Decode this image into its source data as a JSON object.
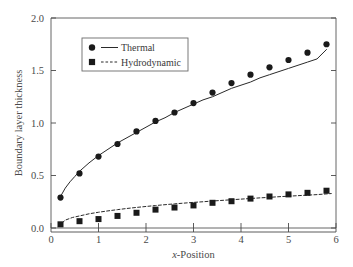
{
  "chart_data": {
    "type": "scatter",
    "title": "",
    "xlabel": "x-Position",
    "xlabel_italic_prefix": "x",
    "xlabel_rest": "-Position",
    "ylabel": "Boundary layer thickness",
    "xlim": [
      0,
      6
    ],
    "ylim": [
      0.0,
      2.0
    ],
    "xticks": [
      "0",
      "1",
      "2",
      "3",
      "4",
      "5",
      "6"
    ],
    "xtick_values": [
      0,
      1,
      2,
      3,
      4,
      5,
      6
    ],
    "yticks": [
      "0.0",
      "0.5",
      "1.0",
      "1.5",
      "2.0"
    ],
    "ytick_values": [
      0.0,
      0.5,
      1.0,
      1.5,
      2.0
    ],
    "grid": false,
    "legend_position": "upper-left-inside",
    "x": [
      0.2,
      0.6,
      1.0,
      1.4,
      1.8,
      2.2,
      2.6,
      3.0,
      3.4,
      3.8,
      4.2,
      4.6,
      5.0,
      5.4,
      5.8
    ],
    "series": [
      {
        "name": "Thermal",
        "marker": "circle",
        "line": "solid",
        "color": "#1a1a1a",
        "values": [
          0.29,
          0.52,
          0.68,
          0.8,
          0.92,
          1.02,
          1.1,
          1.19,
          1.29,
          1.38,
          1.46,
          1.53,
          1.6,
          1.67,
          1.75
        ],
        "fit_curve": {
          "form": "power",
          "points": [
            [
              0.2,
              0.3
            ],
            [
              0.3,
              0.38
            ],
            [
              0.4,
              0.44
            ],
            [
              0.5,
              0.49
            ],
            [
              0.6,
              0.54
            ],
            [
              0.8,
              0.62
            ],
            [
              1.0,
              0.69
            ],
            [
              1.2,
              0.75
            ],
            [
              1.4,
              0.81
            ],
            [
              1.6,
              0.86
            ],
            [
              1.8,
              0.91
            ],
            [
              2.0,
              0.96
            ],
            [
              2.2,
              1.01
            ],
            [
              2.4,
              1.05
            ],
            [
              2.6,
              1.1
            ],
            [
              2.8,
              1.14
            ],
            [
              3.0,
              1.18
            ],
            [
              3.2,
              1.22
            ],
            [
              3.4,
              1.25
            ],
            [
              3.6,
              1.29
            ],
            [
              3.8,
              1.33
            ],
            [
              4.0,
              1.36
            ],
            [
              4.2,
              1.39
            ],
            [
              4.4,
              1.43
            ],
            [
              4.6,
              1.46
            ],
            [
              4.8,
              1.49
            ],
            [
              5.0,
              1.52
            ],
            [
              5.2,
              1.55
            ],
            [
              5.4,
              1.58
            ],
            [
              5.6,
              1.61
            ],
            [
              5.8,
              1.7
            ]
          ]
        }
      },
      {
        "name": "Hydrodynamic",
        "marker": "square",
        "line": "dashed",
        "color": "#1a1a1a",
        "values": [
          0.035,
          0.065,
          0.085,
          0.115,
          0.145,
          0.175,
          0.195,
          0.215,
          0.24,
          0.255,
          0.28,
          0.3,
          0.32,
          0.335,
          0.355
        ],
        "fit_curve": {
          "form": "power",
          "points": [
            [
              0.15,
              0.015
            ],
            [
              0.3,
              0.075
            ],
            [
              0.45,
              0.1
            ],
            [
              0.6,
              0.115
            ],
            [
              0.8,
              0.135
            ],
            [
              1.0,
              0.15
            ],
            [
              1.2,
              0.163
            ],
            [
              1.4,
              0.175
            ],
            [
              1.6,
              0.186
            ],
            [
              1.8,
              0.196
            ],
            [
              2.0,
              0.205
            ],
            [
              2.2,
              0.214
            ],
            [
              2.4,
              0.222
            ],
            [
              2.6,
              0.23
            ],
            [
              2.8,
              0.237
            ],
            [
              3.0,
              0.244
            ],
            [
              3.2,
              0.25
            ],
            [
              3.4,
              0.257
            ],
            [
              3.6,
              0.263
            ],
            [
              3.8,
              0.269
            ],
            [
              4.0,
              0.275
            ],
            [
              4.2,
              0.281
            ],
            [
              4.4,
              0.287
            ],
            [
              4.6,
              0.292
            ],
            [
              4.8,
              0.298
            ],
            [
              5.0,
              0.303
            ],
            [
              5.2,
              0.308
            ],
            [
              5.4,
              0.313
            ],
            [
              5.6,
              0.318
            ],
            [
              5.9,
              0.328
            ]
          ]
        }
      }
    ],
    "legend_entries": [
      {
        "label": "Thermal",
        "marker": "circle",
        "line": "solid"
      },
      {
        "label": "Hydrodynamic",
        "marker": "square",
        "line": "dashed"
      }
    ],
    "colors": {
      "axis": "#4a4a4a",
      "frame": "#555555",
      "marker": "#1a1a1a",
      "curve": "#2a2a2a",
      "background": "#ffffff",
      "legend_border": "#6a6a6a"
    }
  }
}
